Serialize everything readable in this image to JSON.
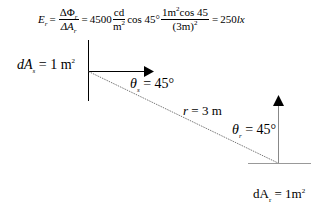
{
  "formula": {
    "lhs_var": "E",
    "lhs_sub": "r",
    "frac1_num": "ΔΦ",
    "frac1_num_sub": "r",
    "frac1_den": "ΔA",
    "frac1_den_sub": "r",
    "eq1": "=",
    "coef": "4500",
    "unit_num": "cd",
    "unit_den": "m",
    "unit_den_sup": "2",
    "cos_term": "cos 45°",
    "frac2_num": "1m",
    "frac2_num_sup": "2",
    "frac2_num_rest": "cos 45",
    "frac2_den": "(3m)",
    "frac2_den_sup": "2",
    "eq2": "=",
    "result": "250",
    "result_unit": "lx"
  },
  "labels": {
    "source_area_var": "dA",
    "source_area_sub": "s",
    "source_area_eq": " = 1 m",
    "source_area_sup": "2",
    "theta_s_var": "θ",
    "theta_s_sub": "s",
    "theta_s_eq": " = 45°",
    "distance_var": "r",
    "distance_eq": " = 3 m",
    "theta_r_var": "θ",
    "theta_r_sub": "r",
    "theta_r_eq": " = 45°",
    "receiver_area_var": "dA",
    "receiver_area_sub": "r",
    "receiver_area_eq": " = 1m",
    "receiver_area_sup": "2"
  },
  "colors": {
    "line": "#000000",
    "dashed_line": "#555555",
    "receiver_line": "#888888",
    "background": "#ffffff"
  }
}
